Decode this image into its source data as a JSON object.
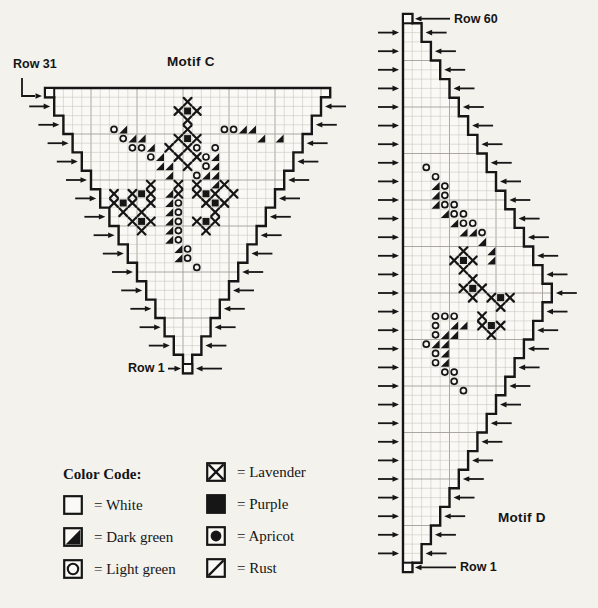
{
  "page": {
    "ink_color": "#161616",
    "paper_color": "#f3f2ed",
    "grid_minor_color": "#c6c4bc",
    "grid_major_color": "#a09e97"
  },
  "legend": {
    "title": "Color Code:",
    "items": [
      {
        "symbol": "white",
        "label": "= White",
        "column": 1
      },
      {
        "symbol": "dark_green",
        "label": "= Dark green",
        "column": 1
      },
      {
        "symbol": "light_green",
        "label": "= Light green",
        "column": 1
      },
      {
        "symbol": "lavender",
        "label": "= Lavender",
        "column": 2
      },
      {
        "symbol": "purple",
        "label": "= Purple",
        "column": 2
      },
      {
        "symbol": "apricot",
        "label": "= Apricot",
        "column": 2
      },
      {
        "symbol": "rust",
        "label": "= Rust",
        "column": 2
      }
    ]
  },
  "motif_c": {
    "title": "Motif C",
    "top_row_label": "Row 31",
    "bottom_row_label": "Row 1",
    "row_count": 31,
    "col_count": 31,
    "left_arrow_count": 14,
    "right_arrow_count": 14,
    "rows": [
      [
        1,
        31
      ],
      [
        2,
        30
      ],
      [
        2,
        30
      ],
      [
        3,
        29
      ],
      [
        3,
        29
      ],
      [
        4,
        28
      ],
      [
        4,
        28
      ],
      [
        5,
        27
      ],
      [
        5,
        27
      ],
      [
        6,
        26
      ],
      [
        6,
        26
      ],
      [
        7,
        25
      ],
      [
        7,
        25
      ],
      [
        8,
        24
      ],
      [
        8,
        24
      ],
      [
        9,
        23
      ],
      [
        9,
        23
      ],
      [
        10,
        22
      ],
      [
        10,
        22
      ],
      [
        11,
        21
      ],
      [
        11,
        21
      ],
      [
        12,
        20
      ],
      [
        12,
        20
      ],
      [
        13,
        19
      ],
      [
        13,
        19
      ],
      [
        14,
        18
      ],
      [
        14,
        18
      ],
      [
        15,
        17
      ],
      [
        15,
        17
      ],
      [
        16,
        16
      ],
      [
        16,
        16
      ]
    ],
    "marker_cells": [
      [
        1,
        1
      ],
      [
        31,
        16
      ]
    ],
    "symbols": [
      [
        2,
        16,
        "X"
      ],
      [
        3,
        15,
        "X"
      ],
      [
        3,
        16,
        "P"
      ],
      [
        3,
        17,
        "X"
      ],
      [
        4,
        16,
        "X"
      ],
      [
        5,
        8,
        "O"
      ],
      [
        5,
        9,
        "D"
      ],
      [
        5,
        16,
        "X"
      ],
      [
        5,
        20,
        "O"
      ],
      [
        5,
        21,
        "O"
      ],
      [
        5,
        22,
        "D"
      ],
      [
        5,
        23,
        "D"
      ],
      [
        6,
        9,
        "O"
      ],
      [
        6,
        10,
        "D"
      ],
      [
        6,
        11,
        "D"
      ],
      [
        6,
        15,
        "X"
      ],
      [
        6,
        16,
        "P"
      ],
      [
        6,
        17,
        "X"
      ],
      [
        6,
        24,
        "D"
      ],
      [
        6,
        26,
        "D"
      ],
      [
        7,
        10,
        "O"
      ],
      [
        7,
        11,
        "O"
      ],
      [
        7,
        12,
        "D"
      ],
      [
        7,
        14,
        "X"
      ],
      [
        7,
        16,
        "X"
      ],
      [
        7,
        17,
        "O"
      ],
      [
        7,
        19,
        "O"
      ],
      [
        8,
        12,
        "O"
      ],
      [
        8,
        13,
        "D"
      ],
      [
        8,
        15,
        "X"
      ],
      [
        8,
        17,
        "X"
      ],
      [
        8,
        18,
        "O"
      ],
      [
        8,
        19,
        "D"
      ],
      [
        9,
        13,
        "D"
      ],
      [
        9,
        14,
        "D"
      ],
      [
        9,
        16,
        "X"
      ],
      [
        9,
        18,
        "O"
      ],
      [
        9,
        19,
        "D"
      ],
      [
        10,
        14,
        "D"
      ],
      [
        10,
        17,
        "O"
      ],
      [
        10,
        18,
        "D"
      ],
      [
        10,
        19,
        "D"
      ],
      [
        11,
        12,
        "X"
      ],
      [
        11,
        15,
        "X"
      ],
      [
        11,
        17,
        "X"
      ],
      [
        11,
        19,
        "D"
      ],
      [
        11,
        20,
        "X"
      ],
      [
        12,
        8,
        "X"
      ],
      [
        12,
        10,
        "X"
      ],
      [
        12,
        11,
        "P"
      ],
      [
        12,
        12,
        "X"
      ],
      [
        12,
        14,
        "D"
      ],
      [
        12,
        15,
        "X"
      ],
      [
        12,
        17,
        "X"
      ],
      [
        12,
        18,
        "P"
      ],
      [
        12,
        19,
        "X"
      ],
      [
        12,
        21,
        "X"
      ],
      [
        13,
        8,
        "X"
      ],
      [
        13,
        9,
        "P"
      ],
      [
        13,
        10,
        "X"
      ],
      [
        13,
        12,
        "X"
      ],
      [
        13,
        14,
        "D"
      ],
      [
        13,
        15,
        "O"
      ],
      [
        13,
        18,
        "X"
      ],
      [
        13,
        19,
        "P"
      ],
      [
        13,
        20,
        "X"
      ],
      [
        14,
        9,
        "X"
      ],
      [
        14,
        11,
        "X"
      ],
      [
        14,
        14,
        "D"
      ],
      [
        14,
        15,
        "O"
      ],
      [
        14,
        19,
        "X"
      ],
      [
        15,
        10,
        "X"
      ],
      [
        15,
        11,
        "P"
      ],
      [
        15,
        12,
        "X"
      ],
      [
        15,
        14,
        "D"
      ],
      [
        15,
        15,
        "O"
      ],
      [
        15,
        17,
        "X"
      ],
      [
        15,
        18,
        "P"
      ],
      [
        15,
        19,
        "X"
      ],
      [
        16,
        11,
        "X"
      ],
      [
        16,
        14,
        "D"
      ],
      [
        16,
        15,
        "O"
      ],
      [
        16,
        18,
        "X"
      ],
      [
        17,
        14,
        "D"
      ],
      [
        17,
        15,
        "O"
      ],
      [
        18,
        15,
        "D"
      ],
      [
        18,
        16,
        "O"
      ],
      [
        19,
        15,
        "D"
      ],
      [
        19,
        16,
        "O"
      ],
      [
        20,
        17,
        "O"
      ]
    ]
  },
  "motif_d": {
    "title": "Motif D",
    "top_row_label": "Row 60",
    "bottom_row_label": "Row 1",
    "row_count": 60,
    "col_count": 16,
    "left_arrow_count": 29,
    "right_arrow_count": 29,
    "rows": [
      [
        1,
        1
      ],
      [
        1,
        2
      ],
      [
        1,
        2
      ],
      [
        1,
        3
      ],
      [
        1,
        3
      ],
      [
        1,
        4
      ],
      [
        1,
        4
      ],
      [
        1,
        5
      ],
      [
        1,
        5
      ],
      [
        1,
        6
      ],
      [
        1,
        6
      ],
      [
        1,
        7
      ],
      [
        1,
        7
      ],
      [
        1,
        8
      ],
      [
        1,
        8
      ],
      [
        1,
        9
      ],
      [
        1,
        9
      ],
      [
        1,
        10
      ],
      [
        1,
        10
      ],
      [
        1,
        11
      ],
      [
        1,
        11
      ],
      [
        1,
        12
      ],
      [
        1,
        12
      ],
      [
        1,
        13
      ],
      [
        1,
        13
      ],
      [
        1,
        14
      ],
      [
        1,
        14
      ],
      [
        1,
        15
      ],
      [
        1,
        15
      ],
      [
        1,
        16
      ],
      [
        1,
        16
      ],
      [
        1,
        15
      ],
      [
        1,
        15
      ],
      [
        1,
        14
      ],
      [
        1,
        14
      ],
      [
        1,
        13
      ],
      [
        1,
        13
      ],
      [
        1,
        12
      ],
      [
        1,
        12
      ],
      [
        1,
        11
      ],
      [
        1,
        11
      ],
      [
        1,
        10
      ],
      [
        1,
        10
      ],
      [
        1,
        9
      ],
      [
        1,
        9
      ],
      [
        1,
        8
      ],
      [
        1,
        8
      ],
      [
        1,
        7
      ],
      [
        1,
        7
      ],
      [
        1,
        6
      ],
      [
        1,
        6
      ],
      [
        1,
        5
      ],
      [
        1,
        5
      ],
      [
        1,
        4
      ],
      [
        1,
        4
      ],
      [
        1,
        3
      ],
      [
        1,
        3
      ],
      [
        1,
        2
      ],
      [
        1,
        2
      ],
      [
        1,
        1
      ]
    ],
    "marker_cells": [
      [
        1,
        1
      ],
      [
        60,
        1
      ]
    ],
    "symbols": [
      [
        17,
        3,
        "O"
      ],
      [
        18,
        4,
        "O"
      ],
      [
        19,
        4,
        "D"
      ],
      [
        19,
        5,
        "O"
      ],
      [
        20,
        4,
        "D"
      ],
      [
        20,
        5,
        "O"
      ],
      [
        21,
        4,
        "D"
      ],
      [
        21,
        5,
        "O"
      ],
      [
        21,
        6,
        "O"
      ],
      [
        22,
        5,
        "D"
      ],
      [
        22,
        6,
        "O"
      ],
      [
        22,
        7,
        "O"
      ],
      [
        23,
        6,
        "D"
      ],
      [
        23,
        7,
        "O"
      ],
      [
        23,
        8,
        "O"
      ],
      [
        24,
        7,
        "D"
      ],
      [
        24,
        8,
        "D"
      ],
      [
        24,
        9,
        "O"
      ],
      [
        25,
        9,
        "D"
      ],
      [
        26,
        7,
        "X"
      ],
      [
        26,
        10,
        "D"
      ],
      [
        27,
        6,
        "X"
      ],
      [
        27,
        7,
        "P"
      ],
      [
        27,
        8,
        "X"
      ],
      [
        27,
        10,
        "D"
      ],
      [
        28,
        7,
        "X"
      ],
      [
        29,
        8,
        "X"
      ],
      [
        30,
        7,
        "X"
      ],
      [
        30,
        8,
        "P"
      ],
      [
        30,
        9,
        "X"
      ],
      [
        31,
        8,
        "X"
      ],
      [
        31,
        10,
        "X"
      ],
      [
        31,
        11,
        "P"
      ],
      [
        31,
        12,
        "X"
      ],
      [
        32,
        11,
        "X"
      ],
      [
        33,
        4,
        "O"
      ],
      [
        33,
        5,
        "O"
      ],
      [
        33,
        6,
        "O"
      ],
      [
        33,
        9,
        "X"
      ],
      [
        34,
        4,
        "O"
      ],
      [
        34,
        6,
        "D"
      ],
      [
        34,
        7,
        "D"
      ],
      [
        34,
        9,
        "X"
      ],
      [
        34,
        10,
        "P"
      ],
      [
        34,
        11,
        "X"
      ],
      [
        35,
        4,
        "O"
      ],
      [
        35,
        5,
        "D"
      ],
      [
        35,
        6,
        "D"
      ],
      [
        35,
        10,
        "X"
      ],
      [
        36,
        3,
        "O"
      ],
      [
        36,
        4,
        "D"
      ],
      [
        36,
        5,
        "D"
      ],
      [
        37,
        4,
        "O"
      ],
      [
        37,
        5,
        "D"
      ],
      [
        38,
        4,
        "O"
      ],
      [
        38,
        5,
        "D"
      ],
      [
        39,
        5,
        "O"
      ],
      [
        39,
        6,
        "O"
      ],
      [
        40,
        6,
        "O"
      ],
      [
        41,
        7,
        "O"
      ]
    ]
  }
}
